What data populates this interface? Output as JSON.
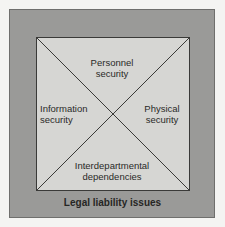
{
  "diagram": {
    "quadrants": {
      "top": [
        "Personnel",
        "security"
      ],
      "left": [
        "Information",
        "security"
      ],
      "right": [
        "Physical",
        "security"
      ],
      "bottom": [
        "Interdepartmental",
        "dependencies"
      ]
    },
    "footer": "Legal liability issues",
    "colors": {
      "outer_fill": "#9a9a98",
      "inner_fill": "#d6d6d3",
      "line": "#3a3a38",
      "background": "#f4f4f2"
    }
  }
}
